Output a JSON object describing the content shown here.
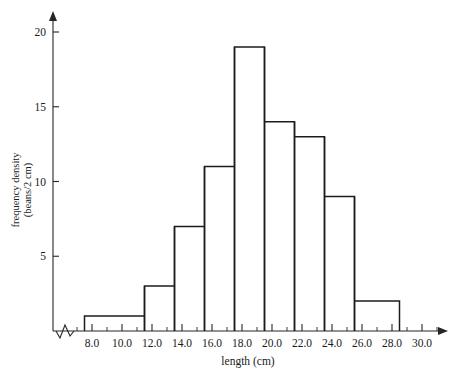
{
  "chart_data": {
    "type": "bar",
    "title": "",
    "xlabel": "length (cm)",
    "ylabel_line1": "frequency density",
    "ylabel_line2": "(beans/2 cm)",
    "xlim": [
      6.5,
      31.5
    ],
    "ylim": [
      0,
      21
    ],
    "grid": false,
    "legend": null,
    "axis_break_x": true,
    "x_major_ticks": [
      8.0,
      10.0,
      12.0,
      14.0,
      16.0,
      18.0,
      20.0,
      22.0,
      24.0,
      26.0,
      28.0,
      30.0
    ],
    "x_major_tick_labels": [
      "8.0",
      "10.0",
      "12.0",
      "14.0",
      "16.0",
      "18.0",
      "20.0",
      "22.0",
      "24.0",
      "26.0",
      "28.0",
      "30.0"
    ],
    "x_minor_ticks": [
      7.0,
      9.0,
      11.0,
      13.0,
      15.0,
      17.0,
      19.0,
      21.0,
      23.0,
      25.0,
      27.0,
      29.0,
      31.0
    ],
    "y_major_ticks": [
      5,
      10,
      15,
      20
    ],
    "y_major_tick_labels": [
      "5",
      "10",
      "15",
      "20"
    ],
    "bin_edges": [
      7.5,
      11.5,
      13.5,
      15.5,
      17.5,
      19.5,
      21.5,
      23.5,
      25.5,
      28.5
    ],
    "values": [
      1,
      3,
      7,
      11,
      19,
      14,
      13,
      9,
      2
    ],
    "bins": [
      {
        "from": 7.5,
        "to": 11.5,
        "height": 1
      },
      {
        "from": 11.5,
        "to": 13.5,
        "height": 3
      },
      {
        "from": 13.5,
        "to": 15.5,
        "height": 7
      },
      {
        "from": 15.5,
        "to": 17.5,
        "height": 11
      },
      {
        "from": 17.5,
        "to": 19.5,
        "height": 19
      },
      {
        "from": 19.5,
        "to": 21.5,
        "height": 14
      },
      {
        "from": 21.5,
        "to": 23.5,
        "height": 13
      },
      {
        "from": 23.5,
        "to": 25.5,
        "height": 9
      },
      {
        "from": 25.5,
        "to": 28.5,
        "height": 2
      }
    ],
    "colors": {
      "bar_stroke": "#1c1c1c",
      "bar_fill": "none",
      "axis": "#262626",
      "text": "#1a1a1a",
      "background": "#ffffff"
    }
  }
}
